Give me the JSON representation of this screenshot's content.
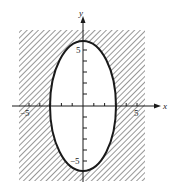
{
  "figure": {
    "type": "graph-of-inequality",
    "axes": {
      "x_label": "x",
      "y_label": "y",
      "x_tick_labels": [
        "−5",
        "5"
      ],
      "y_tick_labels": [
        "5",
        "−5"
      ],
      "x_range": [
        -6.5,
        7
      ],
      "y_range": [
        -7,
        8.5
      ]
    },
    "curve": {
      "shape": "ellipse",
      "center": [
        0,
        0
      ],
      "semi_axis_x": 3,
      "semi_axis_y": 6,
      "line_style": "solid"
    },
    "shading": {
      "region": "outside ellipse",
      "pattern": "diagonal hatching",
      "bounds": {
        "x": [
          -6,
          6
        ],
        "y": [
          -7,
          7
        ]
      }
    },
    "colors": {
      "background": "#ffffff",
      "ink": "#1a1a1a",
      "hatch": "#6b6b6b"
    }
  }
}
